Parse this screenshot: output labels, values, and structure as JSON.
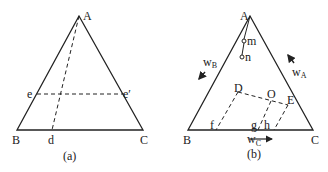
{
  "figures": [
    {
      "id": "a",
      "caption": "(a)",
      "vertices": {
        "A": "A",
        "B": "B",
        "C": "C"
      },
      "points": {
        "e": "e",
        "e_prime": "e′",
        "d": "d"
      }
    },
    {
      "id": "b",
      "caption": "(b)",
      "vertices": {
        "A": "A",
        "B": "B",
        "C": "C"
      },
      "points": {
        "m": "m",
        "n": "n",
        "D": "D",
        "O": "O",
        "E": "E",
        "f": "f",
        "g": "g",
        "h": "h"
      },
      "axes": {
        "wA": {
          "base": "w",
          "sub": "A"
        },
        "wB": {
          "base": "w",
          "sub": "B"
        },
        "wC": {
          "base": "w",
          "sub": "C"
        }
      }
    }
  ],
  "colors": {
    "line": "#222222",
    "background": "#ffffff"
  }
}
